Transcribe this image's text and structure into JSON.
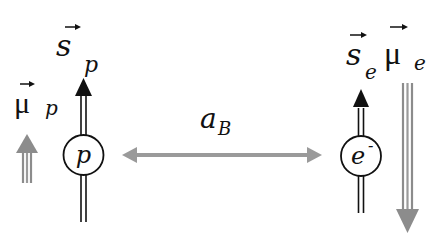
{
  "diagram": {
    "proton": {
      "label": "p",
      "spin_symbol": "s",
      "spin_subscript": "p",
      "moment_symbol": "μ",
      "moment_subscript": "p",
      "spin_direction": "up",
      "moment_direction": "up",
      "moment_size": "small"
    },
    "electron": {
      "label": "e",
      "label_superscript": "-",
      "spin_symbol": "s",
      "spin_subscript": "e",
      "moment_symbol": "μ",
      "moment_subscript": "e",
      "spin_direction": "up",
      "moment_direction": "down",
      "moment_size": "large"
    },
    "separation": {
      "symbol": "a",
      "subscript": "B"
    },
    "colors": {
      "spin_arrow": "#111111",
      "moment_arrow": "#8c8c8c",
      "separation_arrow": "#9a9a9a",
      "background": "#ffffff"
    }
  }
}
